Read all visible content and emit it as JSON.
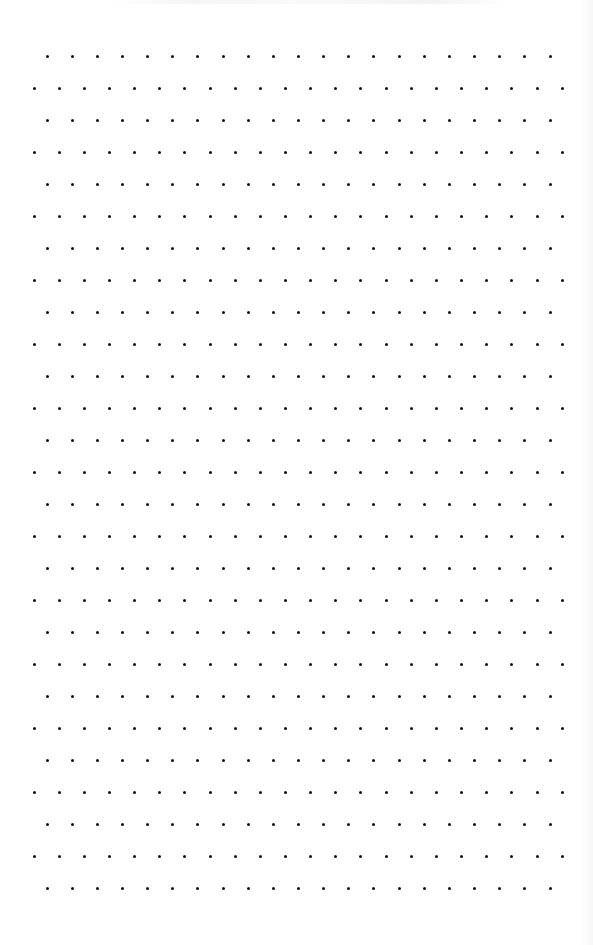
{
  "page": {
    "type": "dot-grid-paper",
    "width": 593,
    "height": 945,
    "background_color": "#ffffff",
    "dot_color": "#111111",
    "dot_size": 3
  },
  "grid": {
    "row_count": 27,
    "first_row_y": 56,
    "row_spacing": 32,
    "column_spacing": 25.15,
    "row_pattern": [
      {
        "kind": "offset",
        "start_x": 47,
        "dot_count": 21
      },
      {
        "kind": "full",
        "start_x": 34,
        "dot_count": 22
      }
    ]
  },
  "decorations": {
    "top_bleed": "faint illegible show-through text at top edge",
    "right_edge_shade": true
  }
}
